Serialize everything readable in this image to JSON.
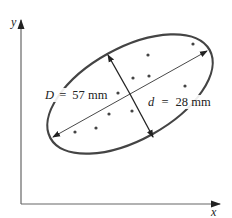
{
  "diagram": {
    "axes": {
      "x_label": "x",
      "y_label": "y",
      "color": "#555555"
    },
    "ellipse": {
      "stroke": "#444444",
      "major_axis_label_var": "D",
      "major_axis_label_eq": "=",
      "major_axis_label_value": "57 mm",
      "minor_axis_label_var": "d",
      "minor_axis_label_eq": "=",
      "minor_axis_label_value": "28 mm"
    },
    "points_count": 10,
    "point_color": "#444444"
  }
}
